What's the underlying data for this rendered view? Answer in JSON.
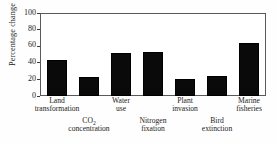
{
  "chart_data": {
    "type": "bar",
    "title": "",
    "xlabel": "",
    "ylabel": "Percentage change",
    "ylim": [
      0,
      100
    ],
    "yticks": [
      0,
      20,
      40,
      60,
      80,
      100
    ],
    "grid": false,
    "legend": "none",
    "categories": [
      "Land transformation",
      "CO2 concentration",
      "Water use",
      "Nitrogen fixation",
      "Plant invasion",
      "Bird extinction",
      "Marine fisheries"
    ],
    "category_lines": [
      {
        "line1": "Land",
        "line2": "transformation",
        "row": "upper"
      },
      {
        "line1": "CO",
        "sub": "2",
        "line2": "concentration",
        "row": "lower"
      },
      {
        "line1": "Water",
        "line2": "use",
        "row": "upper"
      },
      {
        "line1": "Nitrogen",
        "line2": "fixation",
        "row": "lower"
      },
      {
        "line1": "Plant",
        "line2": "invasion",
        "row": "upper"
      },
      {
        "line1": "Bird",
        "line2": "extinction",
        "row": "lower"
      },
      {
        "line1": "Marine",
        "line2": "fisheries",
        "row": "upper"
      }
    ],
    "values": [
      44,
      23,
      52,
      54,
      21,
      24,
      65
    ],
    "bar_color": "#0a0a0a",
    "axis_color": "#5a5a5a"
  },
  "axis": {
    "tick_0": "0",
    "tick_20": "20",
    "tick_40": "40",
    "tick_60": "60",
    "tick_80": "80",
    "tick_100": "100",
    "y_title": "Percentage change"
  },
  "labels": {
    "c0_l1": "Land",
    "c0_l2": "transformation",
    "c1_l1": "CO",
    "c1_sub": "2",
    "c1_l2": "concentration",
    "c2_l1": "Water",
    "c2_l2": "use",
    "c3_l1": "Nitrogen",
    "c3_l2": "fixation",
    "c4_l1": "Plant",
    "c4_l2": "invasion",
    "c5_l1": "Bird",
    "c5_l2": "extinction",
    "c6_l1": "Marine",
    "c6_l2": "fisheries"
  }
}
